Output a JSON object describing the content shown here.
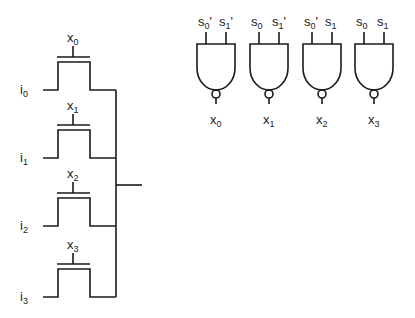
{
  "mux": {
    "rows": [
      {
        "input": "i",
        "input_sub": "0",
        "gate": "x",
        "gate_sub": "0"
      },
      {
        "input": "i",
        "input_sub": "1",
        "gate": "x",
        "gate_sub": "1"
      },
      {
        "input": "i",
        "input_sub": "2",
        "gate": "x",
        "gate_sub": "2"
      },
      {
        "input": "i",
        "input_sub": "3",
        "gate": "x",
        "gate_sub": "3"
      }
    ]
  },
  "decoder": {
    "gates": [
      {
        "in_a": "s",
        "in_a_sub": "0",
        "in_a_prime": "'",
        "in_b": "s",
        "in_b_sub": "1",
        "in_b_prime": "'",
        "out": "x",
        "out_sub": "0"
      },
      {
        "in_a": "s",
        "in_a_sub": "0",
        "in_a_prime": "",
        "in_b": "s",
        "in_b_sub": "1",
        "in_b_prime": "'",
        "out": "x",
        "out_sub": "1"
      },
      {
        "in_a": "s",
        "in_a_sub": "0",
        "in_a_prime": "'",
        "in_b": "s",
        "in_b_sub": "1",
        "in_b_prime": "",
        "out": "x",
        "out_sub": "2"
      },
      {
        "in_a": "s",
        "in_a_sub": "0",
        "in_a_prime": "",
        "in_b": "s",
        "in_b_sub": "1",
        "in_b_prime": "",
        "out": "x",
        "out_sub": "3"
      }
    ]
  }
}
